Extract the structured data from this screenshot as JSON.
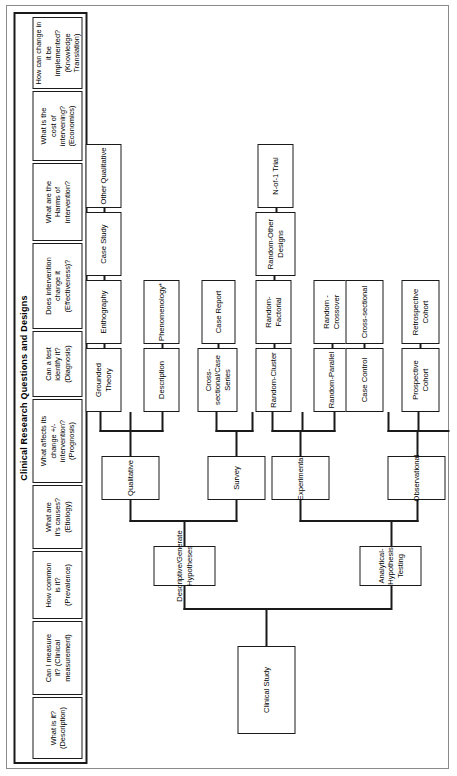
{
  "figure": {
    "title": "Clinical Research  Questions and Designs",
    "orientation": "rotated-90-ccw"
  },
  "questions": [
    {
      "id": "description",
      "text": "What is it?\n(Description)"
    },
    {
      "id": "clinical-measurement",
      "text": "Can I measure\nit? (Clinical\nmeasurement)"
    },
    {
      "id": "prevalence",
      "text": "How common\nis it?\n(Prevalence)"
    },
    {
      "id": "etiology",
      "text": "What are\nit's causes?\n(Etiology)"
    },
    {
      "id": "prognosis",
      "text": "What affects its\nchange +/-\nintervention?\n(Prognosis)"
    },
    {
      "id": "diagnosis",
      "text": "Can a test\nidentify it?\n(Diagnosis)"
    },
    {
      "id": "effectiveness",
      "text": "Does intervention\nchange it\n(Effectiveness)?"
    },
    {
      "id": "harms",
      "text": "What are the\nHarms of\nintervention?"
    },
    {
      "id": "economics",
      "text": "What is the\ncost of\nintervening?\n(Economics)"
    },
    {
      "id": "knowledge-translation",
      "text": "How can change in it be\nimplemented?\n(Knowledge Translation)"
    }
  ],
  "tree": {
    "root": {
      "id": "clinical-study",
      "label": "Clinical Study"
    },
    "level2": [
      {
        "id": "descriptive-generate-hypotheses",
        "label": "Descriptive/Generate\nHypotheses"
      },
      {
        "id": "analytical-hypothesis-testing",
        "label": "Analytical-Hypothesis\nTesting"
      }
    ],
    "level3": [
      {
        "id": "qualitative",
        "label": "Qualitative",
        "parent": "descriptive-generate-hypotheses"
      },
      {
        "id": "survey",
        "label": "Survey",
        "parent": "descriptive-generate-hypotheses"
      },
      {
        "id": "experimental",
        "label": "Experimental",
        "parent": "analytical-hypothesis-testing"
      },
      {
        "id": "observational",
        "label": "Observational",
        "parent": "analytical-hypothesis-testing"
      }
    ],
    "leaves": {
      "qualitative": [
        {
          "id": "description-leaf",
          "label": "Description"
        },
        {
          "id": "phenomenology",
          "label": "Phenomenology*"
        },
        {
          "id": "grounded-theory",
          "label": "Grounded Theory"
        },
        {
          "id": "enthography",
          "label": "Enthography"
        },
        {
          "id": "case-study",
          "label": "Case Study"
        },
        {
          "id": "other-qualitative",
          "label": "Other Qualitative"
        }
      ],
      "survey": [
        {
          "id": "cross-sectional-case-series",
          "label": "Cross-sectional/Case\nSeries"
        },
        {
          "id": "case-report",
          "label": "Case Report"
        }
      ],
      "experimental": [
        {
          "id": "random-parallel",
          "label": "Random-Parallel"
        },
        {
          "id": "random-crossover",
          "label": "Random - Crossover"
        },
        {
          "id": "random-cluster",
          "label": "Random-Cluster"
        },
        {
          "id": "random-factorial",
          "label": "Random- Factorial"
        },
        {
          "id": "random-other-designs",
          "label": "Random-Other\nDesigns"
        },
        {
          "id": "n-of-1-trial",
          "label": "N-of-1 Trial"
        }
      ],
      "observational": [
        {
          "id": "prospective-cohort",
          "label": "Prospective Cohort"
        },
        {
          "id": "retrospective-cohort",
          "label": "Retrospective Cohort"
        },
        {
          "id": "case-control",
          "label": "Case Control"
        },
        {
          "id": "cross-sectional",
          "label": "Cross-sectional"
        }
      ]
    }
  },
  "colors": {
    "line": "#1a1a1a",
    "frame": "#8a8a8a",
    "background": "#ffffff",
    "text": "#000000"
  }
}
